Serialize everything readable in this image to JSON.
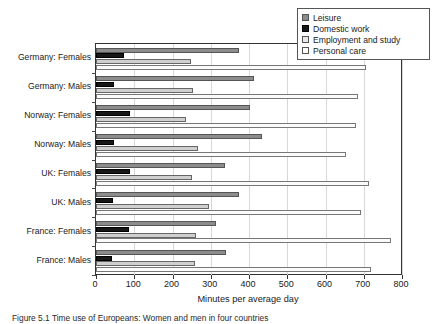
{
  "chart_data": {
    "type": "bar",
    "orientation": "horizontal",
    "title": "",
    "xlabel": "Minutes per average day",
    "ylabel": "",
    "xlim": [
      0,
      800
    ],
    "xticks": [
      0,
      100,
      200,
      300,
      400,
      500,
      600,
      700,
      800
    ],
    "grid": "vertical",
    "legend_position": "top-right",
    "categories": [
      "Germany: Females",
      "Germany: Males",
      "Norway: Females",
      "Norway: Males",
      "UK: Females",
      "UK: Males",
      "France: Females",
      "France: Males"
    ],
    "series": [
      {
        "name": "Leisure",
        "color": "#8c8c8c",
        "values": [
          374,
          413,
          403,
          434,
          337,
          374,
          313,
          340
        ]
      },
      {
        "name": "Domestic work",
        "color": "#171717",
        "values": [
          73,
          47,
          89,
          47,
          89,
          45,
          86,
          42
        ]
      },
      {
        "name": "Employment and study",
        "color": "#cfcfcf",
        "values": [
          248,
          254,
          235,
          267,
          251,
          295,
          261,
          258
        ]
      },
      {
        "name": "Personal care",
        "color": "#fbfbfb",
        "values": [
          706,
          685,
          680,
          654,
          714,
          693,
          772,
          718
        ]
      }
    ]
  },
  "legend": {
    "items": [
      {
        "label": "Leisure",
        "swatch": "leisure"
      },
      {
        "label": "Domestic work",
        "swatch": "domestic"
      },
      {
        "label": "Employment and study",
        "swatch": "employment"
      },
      {
        "label": "Personal care",
        "swatch": "personal"
      }
    ]
  },
  "caption": {
    "text": "Figure 5.1  Time use of Europeans: Women and men in four countries"
  }
}
